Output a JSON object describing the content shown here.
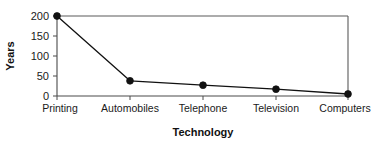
{
  "chart_data": {
    "type": "line",
    "title": "",
    "xlabel": "Technology",
    "ylabel": "Years",
    "categories": [
      "Printing",
      "Automobiles",
      "Telephone",
      "Television",
      "Computers"
    ],
    "values": [
      200,
      38,
      27,
      17,
      5
    ],
    "series": [
      {
        "name": "Years",
        "values": [
          200,
          38,
          27,
          17,
          5
        ]
      }
    ],
    "ylim": [
      0,
      200
    ],
    "yticks": [
      0,
      50,
      100,
      150,
      200
    ],
    "ytick_labels": [
      "0",
      "50",
      "100",
      "150",
      "200"
    ],
    "xtick_labels": [
      "Printing",
      "Automobiles",
      "Telephone",
      "Television",
      "Computers"
    ],
    "grid": false,
    "legend": false,
    "legend_position": "none",
    "marker": "filled-circle",
    "line_color": "#111111",
    "marker_color": "#111111",
    "axis_color": "#4a4a4a",
    "background_color": "#ffffff",
    "frame": "full-rectangle"
  }
}
